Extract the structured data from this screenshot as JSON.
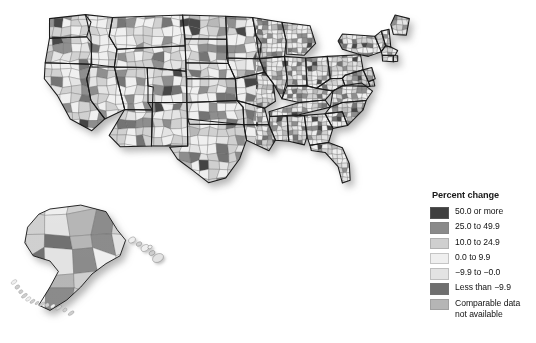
{
  "figure": {
    "kind": "choropleth-map",
    "region": "United States by county, with Alaska and Hawaii insets",
    "background_color": "#ffffff"
  },
  "legend": {
    "title": "Percent change",
    "items": [
      {
        "label": "50.0 or more",
        "color": "#3f3f3f",
        "name": "legend-swatch-50-or-more"
      },
      {
        "label": "25.0 to 49.9",
        "color": "#8a8a8a",
        "name": "legend-swatch-25-to-49"
      },
      {
        "label": "10.0 to 24.9",
        "color": "#cfcfcf",
        "name": "legend-swatch-10-to-24"
      },
      {
        "label": "0.0 to 9.9",
        "color": "#efefef",
        "name": "legend-swatch-0-to-9"
      },
      {
        "label": "−9.9 to −0.0",
        "color": "#e3e3e3",
        "name": "legend-swatch-neg9-to-neg0"
      },
      {
        "label": "Less than −9.9",
        "color": "#6f6f6f",
        "name": "legend-swatch-less-than-neg9"
      },
      {
        "label": "Comparable data\nnot available",
        "color": "#b5b5b5",
        "name": "legend-swatch-not-available"
      }
    ]
  },
  "chart_data": {
    "type": "heatmap",
    "title": "Percent change",
    "subtitle": "",
    "xlabel": "",
    "ylabel": "",
    "legend_position": "bottom-right",
    "grid": false,
    "categories": [
      "50.0 or more",
      "25.0 to 49.9",
      "10.0 to 24.9",
      "0.0 to 9.9",
      "−9.9 to −0.0",
      "Less than −9.9",
      "Comparable data not available"
    ],
    "colors": [
      "#3f3f3f",
      "#8a8a8a",
      "#cfcfcf",
      "#efefef",
      "#e3e3e3",
      "#6f6f6f",
      "#b5b5b5"
    ],
    "map_regions": [
      {
        "name": "Contiguous United States",
        "inset": false
      },
      {
        "name": "Alaska",
        "inset": true
      },
      {
        "name": "Hawaii",
        "inset": true
      }
    ]
  }
}
